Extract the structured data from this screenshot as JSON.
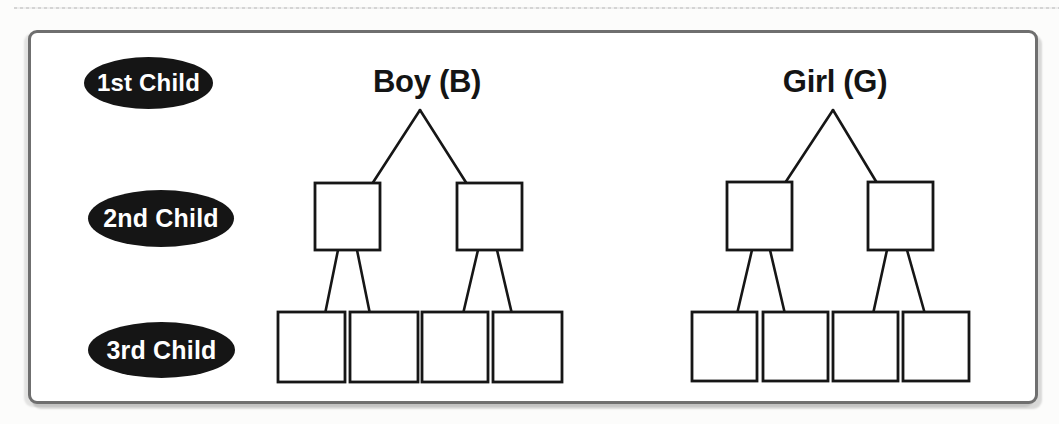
{
  "figure": {
    "row_labels": [
      {
        "label": "1st Child"
      },
      {
        "label": "2nd Child"
      },
      {
        "label": "3rd Child"
      }
    ],
    "trees": [
      {
        "title": "Boy (B)",
        "level2_boxes": [
          "",
          ""
        ],
        "level3_boxes": [
          "",
          "",
          "",
          ""
        ]
      },
      {
        "title": "Girl (G)",
        "level2_boxes": [
          "",
          ""
        ],
        "level3_boxes": [
          "",
          "",
          "",
          ""
        ]
      }
    ],
    "colors": {
      "label_oval_fill": "#151515",
      "label_text": "#ffffff",
      "diagram_line": "#161616",
      "box_fill": "#ffffff",
      "frame_border": "#6f6f6f",
      "paper": "#ffffff"
    }
  }
}
